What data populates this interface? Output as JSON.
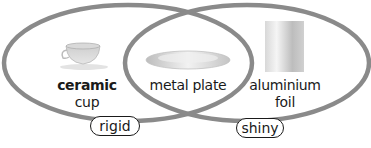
{
  "diagram": {
    "type": "venn",
    "sets": [
      {
        "name": "rigid",
        "label": "rigid"
      },
      {
        "name": "shiny",
        "label": "shiny"
      }
    ],
    "items": [
      {
        "id": "ceramic-cup",
        "bold": "ceramic",
        "rest": " cup",
        "sets": [
          "rigid"
        ],
        "icon": "cup-icon"
      },
      {
        "id": "metal-plate",
        "text": "metal plate",
        "sets": [
          "rigid",
          "shiny"
        ],
        "icon": "plate-icon"
      },
      {
        "id": "aluminium-foil",
        "line1": "aluminium",
        "line2": "foil",
        "sets": [
          "shiny"
        ],
        "icon": "foil-roll-icon"
      }
    ],
    "colors": {
      "outline": "#8a8a8a",
      "text": "#1a1a1a"
    }
  }
}
